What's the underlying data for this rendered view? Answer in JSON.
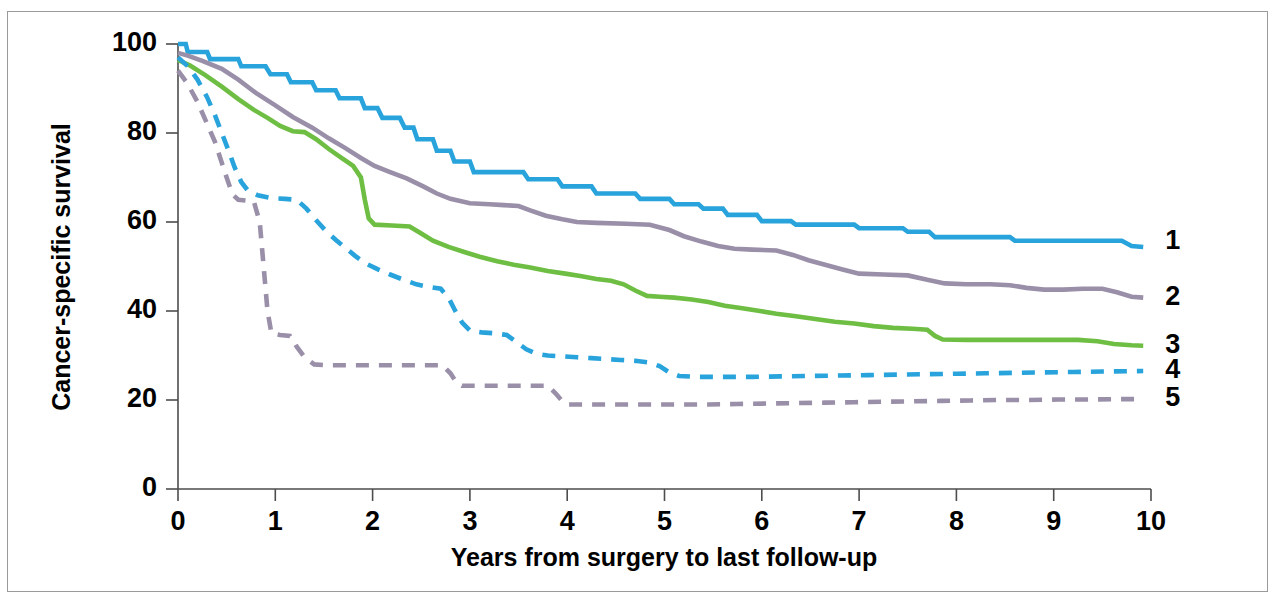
{
  "chart_data": {
    "type": "line",
    "title": "",
    "subtitle": "",
    "xlabel": "Years from surgery to last follow-up",
    "ylabel": "Cancer-specific survival",
    "xlim": [
      0,
      10
    ],
    "ylim": [
      0,
      100
    ],
    "xticks": [
      "0",
      "1",
      "2",
      "3",
      "4",
      "5",
      "6",
      "7",
      "8",
      "9",
      "10"
    ],
    "yticks": [
      "0",
      "20",
      "40",
      "60",
      "80",
      "100"
    ],
    "grid": false,
    "legend_position": "right-end-of-line",
    "annotations": [],
    "series": [
      {
        "name": "1",
        "label": "1",
        "color": "#29A3DC",
        "style": "solid",
        "end_value": 55.5,
        "points": [
          [
            0.0,
            100.0
          ],
          [
            0.08,
            100.0
          ],
          [
            0.1,
            98.2
          ],
          [
            0.3,
            98.2
          ],
          [
            0.33,
            96.6
          ],
          [
            0.62,
            96.6
          ],
          [
            0.65,
            95.0
          ],
          [
            0.9,
            95.0
          ],
          [
            0.95,
            93.2
          ],
          [
            1.12,
            93.2
          ],
          [
            1.16,
            91.4
          ],
          [
            1.38,
            91.4
          ],
          [
            1.42,
            89.6
          ],
          [
            1.62,
            89.6
          ],
          [
            1.66,
            87.8
          ],
          [
            1.88,
            87.8
          ],
          [
            1.92,
            85.6
          ],
          [
            2.05,
            85.6
          ],
          [
            2.1,
            83.4
          ],
          [
            2.28,
            83.4
          ],
          [
            2.33,
            81.2
          ],
          [
            2.42,
            81.2
          ],
          [
            2.46,
            78.6
          ],
          [
            2.62,
            78.6
          ],
          [
            2.66,
            76.0
          ],
          [
            2.8,
            76.0
          ],
          [
            2.84,
            73.6
          ],
          [
            3.0,
            73.6
          ],
          [
            3.04,
            71.2
          ],
          [
            3.55,
            71.2
          ],
          [
            3.6,
            69.6
          ],
          [
            3.9,
            69.6
          ],
          [
            3.95,
            68.0
          ],
          [
            4.25,
            68.0
          ],
          [
            4.3,
            66.4
          ],
          [
            4.7,
            66.4
          ],
          [
            4.75,
            65.2
          ],
          [
            5.05,
            65.2
          ],
          [
            5.1,
            64.0
          ],
          [
            5.35,
            64.0
          ],
          [
            5.4,
            63.0
          ],
          [
            5.6,
            63.0
          ],
          [
            5.65,
            61.6
          ],
          [
            5.95,
            61.6
          ],
          [
            6.0,
            60.2
          ],
          [
            6.3,
            60.2
          ],
          [
            6.35,
            59.4
          ],
          [
            6.95,
            59.4
          ],
          [
            7.0,
            58.6
          ],
          [
            7.45,
            58.6
          ],
          [
            7.5,
            57.8
          ],
          [
            7.72,
            57.8
          ],
          [
            7.78,
            56.6
          ],
          [
            8.55,
            56.6
          ],
          [
            8.6,
            55.8
          ],
          [
            9.7,
            55.8
          ],
          [
            9.8,
            54.6
          ],
          [
            9.92,
            54.4
          ]
        ]
      },
      {
        "name": "2",
        "label": "2",
        "color": "#9A8FA8",
        "style": "solid",
        "end_value": 43.0,
        "points": [
          [
            0.0,
            98.0
          ],
          [
            0.1,
            97.4
          ],
          [
            0.25,
            96.2
          ],
          [
            0.45,
            94.4
          ],
          [
            0.62,
            92.0
          ],
          [
            0.8,
            89.0
          ],
          [
            1.0,
            86.2
          ],
          [
            1.18,
            83.6
          ],
          [
            1.38,
            81.2
          ],
          [
            1.55,
            78.8
          ],
          [
            1.72,
            76.6
          ],
          [
            1.88,
            74.4
          ],
          [
            2.02,
            72.6
          ],
          [
            2.18,
            71.2
          ],
          [
            2.35,
            69.8
          ],
          [
            2.52,
            68.0
          ],
          [
            2.66,
            66.4
          ],
          [
            2.8,
            65.2
          ],
          [
            3.0,
            64.2
          ],
          [
            3.2,
            64.0
          ],
          [
            3.35,
            63.8
          ],
          [
            3.5,
            63.6
          ],
          [
            3.62,
            62.6
          ],
          [
            3.78,
            61.4
          ],
          [
            3.95,
            60.6
          ],
          [
            4.1,
            60.0
          ],
          [
            4.3,
            59.8
          ],
          [
            4.6,
            59.6
          ],
          [
            4.85,
            59.4
          ],
          [
            5.05,
            58.2
          ],
          [
            5.2,
            56.8
          ],
          [
            5.38,
            55.6
          ],
          [
            5.55,
            54.6
          ],
          [
            5.72,
            54.0
          ],
          [
            5.9,
            53.8
          ],
          [
            6.15,
            53.6
          ],
          [
            6.32,
            52.6
          ],
          [
            6.48,
            51.4
          ],
          [
            6.65,
            50.4
          ],
          [
            6.82,
            49.4
          ],
          [
            7.0,
            48.4
          ],
          [
            7.25,
            48.2
          ],
          [
            7.5,
            48.0
          ],
          [
            7.7,
            47.0
          ],
          [
            7.88,
            46.2
          ],
          [
            8.1,
            46.0
          ],
          [
            8.35,
            46.0
          ],
          [
            8.55,
            45.8
          ],
          [
            8.72,
            45.2
          ],
          [
            8.9,
            44.8
          ],
          [
            9.1,
            44.8
          ],
          [
            9.3,
            45.0
          ],
          [
            9.5,
            45.0
          ],
          [
            9.65,
            44.2
          ],
          [
            9.8,
            43.2
          ],
          [
            9.92,
            43.0
          ]
        ]
      },
      {
        "name": "3",
        "label": "3",
        "color": "#6FBE44",
        "style": "solid",
        "end_value": 32.2,
        "points": [
          [
            0.0,
            96.4
          ],
          [
            0.12,
            95.2
          ],
          [
            0.28,
            93.0
          ],
          [
            0.45,
            90.4
          ],
          [
            0.62,
            87.6
          ],
          [
            0.78,
            85.2
          ],
          [
            0.92,
            83.4
          ],
          [
            1.05,
            81.6
          ],
          [
            1.18,
            80.4
          ],
          [
            1.3,
            80.2
          ],
          [
            1.42,
            78.6
          ],
          [
            1.55,
            76.4
          ],
          [
            1.68,
            74.4
          ],
          [
            1.8,
            72.6
          ],
          [
            1.88,
            70.0
          ],
          [
            1.92,
            65.0
          ],
          [
            1.96,
            60.8
          ],
          [
            2.02,
            59.4
          ],
          [
            2.2,
            59.2
          ],
          [
            2.38,
            59.0
          ],
          [
            2.5,
            57.4
          ],
          [
            2.62,
            55.8
          ],
          [
            2.78,
            54.4
          ],
          [
            2.95,
            53.2
          ],
          [
            3.1,
            52.2
          ],
          [
            3.28,
            51.2
          ],
          [
            3.45,
            50.4
          ],
          [
            3.62,
            49.8
          ],
          [
            3.8,
            49.0
          ],
          [
            3.98,
            48.4
          ],
          [
            4.15,
            47.8
          ],
          [
            4.3,
            47.2
          ],
          [
            4.45,
            46.8
          ],
          [
            4.58,
            46.0
          ],
          [
            4.7,
            44.6
          ],
          [
            4.82,
            43.4
          ],
          [
            4.95,
            43.2
          ],
          [
            5.1,
            43.0
          ],
          [
            5.28,
            42.6
          ],
          [
            5.45,
            42.0
          ],
          [
            5.62,
            41.2
          ],
          [
            5.8,
            40.6
          ],
          [
            5.98,
            40.0
          ],
          [
            6.15,
            39.4
          ],
          [
            6.35,
            38.8
          ],
          [
            6.55,
            38.2
          ],
          [
            6.75,
            37.6
          ],
          [
            6.95,
            37.2
          ],
          [
            7.15,
            36.6
          ],
          [
            7.35,
            36.2
          ],
          [
            7.55,
            36.0
          ],
          [
            7.7,
            35.8
          ],
          [
            7.78,
            34.4
          ],
          [
            7.86,
            33.6
          ],
          [
            8.1,
            33.5
          ],
          [
            8.4,
            33.5
          ],
          [
            8.7,
            33.5
          ],
          [
            9.0,
            33.5
          ],
          [
            9.25,
            33.5
          ],
          [
            9.45,
            33.2
          ],
          [
            9.62,
            32.6
          ],
          [
            9.8,
            32.3
          ],
          [
            9.92,
            32.2
          ]
        ]
      },
      {
        "name": "4",
        "label": "4",
        "color": "#29A3DC",
        "style": "dashed",
        "end_value": 26.5,
        "points": [
          [
            0.0,
            97.0
          ],
          [
            0.1,
            95.0
          ],
          [
            0.2,
            92.0
          ],
          [
            0.3,
            88.0
          ],
          [
            0.38,
            84.0
          ],
          [
            0.45,
            80.0
          ],
          [
            0.52,
            76.0
          ],
          [
            0.58,
            72.4
          ],
          [
            0.65,
            69.0
          ],
          [
            0.72,
            67.0
          ],
          [
            0.82,
            66.0
          ],
          [
            0.95,
            65.4
          ],
          [
            1.1,
            65.2
          ],
          [
            1.22,
            65.0
          ],
          [
            1.32,
            63.0
          ],
          [
            1.42,
            60.4
          ],
          [
            1.52,
            58.0
          ],
          [
            1.62,
            56.0
          ],
          [
            1.72,
            54.2
          ],
          [
            1.82,
            52.4
          ],
          [
            1.92,
            50.8
          ],
          [
            2.05,
            49.4
          ],
          [
            2.18,
            48.2
          ],
          [
            2.32,
            47.0
          ],
          [
            2.45,
            46.0
          ],
          [
            2.58,
            45.4
          ],
          [
            2.7,
            45.0
          ],
          [
            2.78,
            43.0
          ],
          [
            2.85,
            40.0
          ],
          [
            2.92,
            37.4
          ],
          [
            3.0,
            35.6
          ],
          [
            3.12,
            35.2
          ],
          [
            3.25,
            35.0
          ],
          [
            3.38,
            34.6
          ],
          [
            3.48,
            33.0
          ],
          [
            3.58,
            31.4
          ],
          [
            3.68,
            30.4
          ],
          [
            3.8,
            30.0
          ],
          [
            3.95,
            29.8
          ],
          [
            4.1,
            29.6
          ],
          [
            4.25,
            29.4
          ],
          [
            4.4,
            29.2
          ],
          [
            4.55,
            29.0
          ],
          [
            4.7,
            28.8
          ],
          [
            4.85,
            28.4
          ],
          [
            4.95,
            27.6
          ],
          [
            5.05,
            26.2
          ],
          [
            5.15,
            25.4
          ],
          [
            5.35,
            25.2
          ],
          [
            5.6,
            25.2
          ],
          [
            5.9,
            25.2
          ],
          [
            6.2,
            25.3
          ],
          [
            6.5,
            25.4
          ],
          [
            6.8,
            25.5
          ],
          [
            7.1,
            25.6
          ],
          [
            7.4,
            25.7
          ],
          [
            7.7,
            25.8
          ],
          [
            8.0,
            25.9
          ],
          [
            8.3,
            26.0
          ],
          [
            8.6,
            26.1
          ],
          [
            8.9,
            26.2
          ],
          [
            9.2,
            26.3
          ],
          [
            9.5,
            26.4
          ],
          [
            9.92,
            26.5
          ]
        ]
      },
      {
        "name": "5",
        "label": "5",
        "color": "#9A8FA8",
        "style": "dashed",
        "end_value": 20.2,
        "points": [
          [
            0.0,
            94.0
          ],
          [
            0.1,
            91.0
          ],
          [
            0.2,
            87.0
          ],
          [
            0.3,
            82.0
          ],
          [
            0.38,
            78.0
          ],
          [
            0.44,
            74.0
          ],
          [
            0.5,
            70.0
          ],
          [
            0.56,
            66.2
          ],
          [
            0.62,
            65.0
          ],
          [
            0.7,
            64.8
          ],
          [
            0.78,
            64.6
          ],
          [
            0.84,
            60.0
          ],
          [
            0.88,
            50.0
          ],
          [
            0.92,
            40.0
          ],
          [
            0.96,
            35.0
          ],
          [
            1.05,
            34.6
          ],
          [
            1.15,
            34.4
          ],
          [
            1.22,
            32.0
          ],
          [
            1.3,
            29.6
          ],
          [
            1.4,
            28.0
          ],
          [
            1.55,
            27.8
          ],
          [
            1.8,
            27.8
          ],
          [
            2.05,
            27.8
          ],
          [
            2.3,
            27.8
          ],
          [
            2.55,
            27.8
          ],
          [
            2.72,
            27.8
          ],
          [
            2.8,
            26.0
          ],
          [
            2.86,
            24.0
          ],
          [
            2.92,
            23.2
          ],
          [
            3.1,
            23.2
          ],
          [
            3.35,
            23.2
          ],
          [
            3.6,
            23.2
          ],
          [
            3.8,
            23.2
          ],
          [
            3.88,
            21.5
          ],
          [
            3.94,
            20.0
          ],
          [
            4.0,
            19.0
          ],
          [
            4.25,
            19.0
          ],
          [
            4.55,
            19.0
          ],
          [
            4.85,
            19.0
          ],
          [
            5.15,
            19.0
          ],
          [
            5.45,
            19.0
          ],
          [
            5.75,
            19.1
          ],
          [
            6.05,
            19.2
          ],
          [
            6.35,
            19.3
          ],
          [
            6.65,
            19.4
          ],
          [
            6.95,
            19.5
          ],
          [
            7.25,
            19.6
          ],
          [
            7.55,
            19.7
          ],
          [
            7.85,
            19.8
          ],
          [
            8.15,
            19.9
          ],
          [
            8.45,
            20.0
          ],
          [
            8.75,
            20.0
          ],
          [
            9.05,
            20.1
          ],
          [
            9.35,
            20.1
          ],
          [
            9.65,
            20.2
          ],
          [
            9.92,
            20.2
          ]
        ]
      }
    ]
  }
}
